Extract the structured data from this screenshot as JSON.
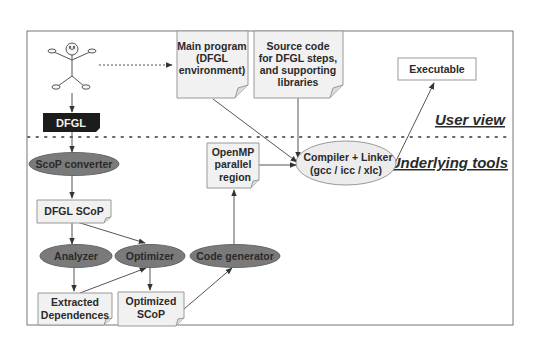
{
  "diagram": {
    "layers": {
      "user_view": "User view",
      "underlying_tools": "Underlying tools"
    },
    "nodes": {
      "dfgl": {
        "label": "DFGL",
        "shape": "black-tag"
      },
      "main_program": {
        "lines": [
          "Main program",
          "(DFGL",
          "environment)"
        ],
        "shape": "note"
      },
      "source_code": {
        "lines": [
          "Source code",
          "for DFGL steps,",
          "and supporting",
          "libraries"
        ],
        "shape": "note"
      },
      "executable": {
        "label": "Executable",
        "shape": "box"
      },
      "compiler": {
        "lines": [
          "Compiler + Linker",
          "(gcc / icc / xlc)"
        ],
        "shape": "ellipse-light"
      },
      "openmp": {
        "lines": [
          "OpenMP",
          "parallel",
          "region"
        ],
        "shape": "note"
      },
      "scop_converter": {
        "label": "ScoP converter",
        "shape": "ellipse-dark"
      },
      "dfgl_scop": {
        "label": "DFGL SCoP",
        "shape": "note"
      },
      "analyzer": {
        "label": "Analyzer",
        "shape": "ellipse-dark"
      },
      "optimizer": {
        "label": "Optimizer",
        "shape": "ellipse-dark"
      },
      "code_generator": {
        "label": "Code generator",
        "shape": "ellipse-dark"
      },
      "extracted_dependences": {
        "lines": [
          "Extracted",
          "Dependences"
        ],
        "shape": "note"
      },
      "optimized_scop": {
        "lines": [
          "Optimized",
          "SCoP"
        ],
        "shape": "note"
      }
    },
    "edges": [
      {
        "from": "user",
        "to": "main_program",
        "style": "dotted"
      },
      {
        "from": "user",
        "to": "dfgl"
      },
      {
        "from": "dfgl",
        "to": "scop_converter"
      },
      {
        "from": "scop_converter",
        "to": "dfgl_scop"
      },
      {
        "from": "dfgl_scop",
        "to": "analyzer"
      },
      {
        "from": "dfgl_scop",
        "to": "optimizer"
      },
      {
        "from": "analyzer",
        "to": "extracted_dependences"
      },
      {
        "from": "extracted_dependences",
        "to": "optimizer"
      },
      {
        "from": "optimizer",
        "to": "optimized_scop"
      },
      {
        "from": "optimized_scop",
        "to": "code_generator"
      },
      {
        "from": "code_generator",
        "to": "openmp"
      },
      {
        "from": "openmp",
        "to": "compiler"
      },
      {
        "from": "main_program",
        "to": "compiler"
      },
      {
        "from": "source_code",
        "to": "compiler"
      },
      {
        "from": "compiler",
        "to": "executable"
      }
    ],
    "colors": {
      "dark_ellipse": "#7a7a7a",
      "light_ellipse": "#ececec",
      "note_fill": "#f1f1f1",
      "dfgl_fill": "#1c1c1c",
      "stroke": "#555555"
    }
  }
}
